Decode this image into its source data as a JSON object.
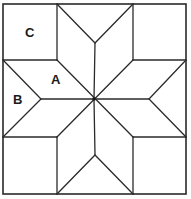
{
  "diagram": {
    "labels": [
      {
        "id": "C",
        "text": "C",
        "x": 25,
        "y": 26
      },
      {
        "id": "A",
        "text": "A",
        "x": 51,
        "y": 73
      },
      {
        "id": "B",
        "text": "B",
        "x": 13,
        "y": 93
      }
    ],
    "geometry": {
      "outer": {
        "left": 3,
        "top": 4,
        "right": 186,
        "bottom": 194
      },
      "grid_x": [
        57,
        133
      ],
      "grid_y": [
        60,
        137
      ],
      "center": [
        94,
        99
      ],
      "notch_apex": {
        "top": [
          95,
          43
        ],
        "bottom": [
          95,
          155
        ],
        "left": [
          41,
          99
        ],
        "right": [
          149,
          99
        ]
      }
    },
    "colors": {
      "line": "#2a2a2a",
      "fill": "#ffffff",
      "text": "#1a1a1a"
    }
  }
}
